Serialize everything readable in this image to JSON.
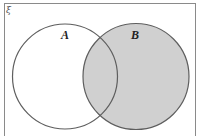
{
  "diagram": {
    "type": "venn",
    "universal_set_label": "ξ",
    "sets": [
      {
        "label": "A",
        "shaded": false
      },
      {
        "label": "B",
        "shaded": true
      }
    ],
    "shaded_region": "B",
    "colors": {
      "background": "#ffffff",
      "border": "#8a8a8a",
      "circle_stroke": "#5e5e5e",
      "shade_fill": "#d0d0d0",
      "label": "#222222"
    }
  }
}
